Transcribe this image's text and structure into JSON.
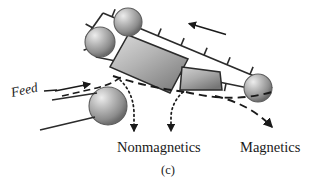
{
  "figure": {
    "caption": "(c)",
    "background_color": "#ffffff",
    "ink_color": "#1a1a1a"
  },
  "labels": {
    "feed": "Feed",
    "nonmagnetics": "Nonmagnetics",
    "magnetics": "Magnetics"
  },
  "diagram": {
    "title_semantic": "magnetic-belt-separator",
    "belt": {
      "direction_label": "",
      "cleat_count_top": 7,
      "cleat_count_bottom": 5,
      "colors": {
        "line": "#2b2b2b"
      }
    },
    "magnets": [
      {
        "name": "large-magnet-block",
        "fill_light": "#d9d9d9",
        "fill_dark": "#7d7d7d"
      },
      {
        "name": "small-magnet-block",
        "fill_light": "#cfcfcf",
        "fill_dark": "#787878"
      }
    ],
    "rollers": [
      {
        "name": "upper-left-roller",
        "cx": 100,
        "cy": 42,
        "r": 15
      },
      {
        "name": "upper-right-roller",
        "cx": 128,
        "cy": 22,
        "r": 14
      },
      {
        "name": "lower-right-roller",
        "cx": 258,
        "cy": 88,
        "r": 14
      },
      {
        "name": "feed-roller",
        "cx": 108,
        "cy": 106,
        "r": 19
      }
    ],
    "trajectories": [
      {
        "name": "nonmagnetics-path-left",
        "style": "dotted"
      },
      {
        "name": "nonmagnetics-path-right",
        "style": "dotted"
      },
      {
        "name": "magnetics-path",
        "style": "dashed"
      }
    ],
    "colors": {
      "sphere_highlight": "#e8e8e8",
      "sphere_mid": "#a8a8a8",
      "sphere_edge": "#6e6e6e"
    }
  }
}
